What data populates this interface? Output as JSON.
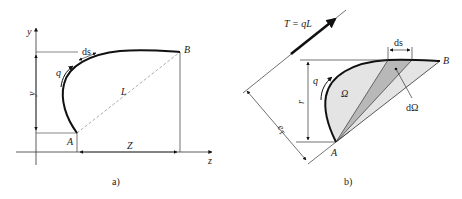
{
  "figure": {
    "panel_a": {
      "caption": "a)",
      "axes": {
        "vertical": "y",
        "horizontal": "z"
      },
      "points": {
        "start": "A",
        "end": "B"
      },
      "labels": {
        "flow": "q",
        "element": "ds",
        "chord": "L",
        "height": "y",
        "width": "Z"
      }
    },
    "panel_b": {
      "caption": "b)",
      "points": {
        "start": "A",
        "end": "B"
      },
      "labels": {
        "force": "T = qL",
        "flow": "q",
        "element": "ds",
        "area": "Ω",
        "area_element": "dΩ",
        "radius": "r",
        "eccentricity": "e",
        "eccentricity_sub": "T"
      }
    },
    "colors": {
      "stroke": "#111111",
      "fill_light": "#e4e4e4",
      "fill_dark": "#b8b8b8",
      "dash": "#777777"
    }
  }
}
